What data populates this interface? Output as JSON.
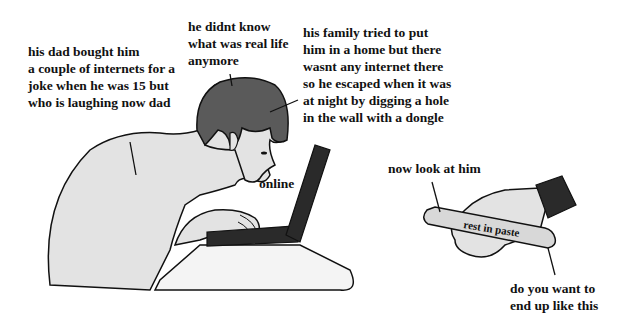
{
  "captions": {
    "dad": "his dad bought him\na couple of internets for a\njoke when he was 15 but\nwho is laughing now dad",
    "real_life": "he didnt know\nwhat was real life\nanymore",
    "family": "his family tried to put\nhim in a home but there\nwasnt any internet there\nso he escaped when it was\nat night by digging a hole\nin the wall with a dongle",
    "online": "online",
    "look": "now look at him",
    "tube_label": "rest in paste",
    "warning": "do you want to\nend up like this"
  },
  "colors": {
    "skin": "#e3e3e3",
    "hair": "#5a5a5a",
    "laptop": "#2a2a2a",
    "table": "#f4f4f4",
    "outline": "#111111"
  }
}
